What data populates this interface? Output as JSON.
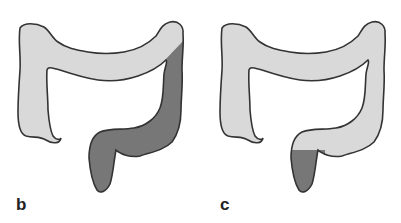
{
  "figure": {
    "panels": [
      {
        "label": "b",
        "description": "Colon diagram with descending colon, sigmoid colon and rectum shaded (left-sided region)",
        "shaded_region": "descending-sigmoid-rectum"
      },
      {
        "label": "c",
        "description": "Colon diagram with only the rectum shaded",
        "shaded_region": "rectum"
      }
    ],
    "colors": {
      "unshaded_fill": "#d9d9d9",
      "shaded_fill": "#777777",
      "outline": "#333333",
      "background": "#ffffff",
      "label": "#222222"
    }
  }
}
